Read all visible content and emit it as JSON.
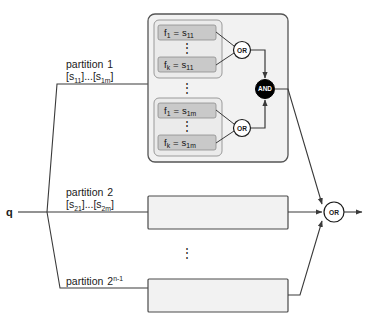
{
  "figure": {
    "input_label": "q",
    "output_gate_label": "OR",
    "vertical_ellipsis": "⋮",
    "colors": {
      "pill_fill": "#c9c9c9",
      "pill_stroke": "#8d8d8d",
      "inner_box_fill": "#ebebeb",
      "inner_box_stroke": "#9a9a9a",
      "outer_box_fill": "#f2f2f2",
      "outer_box_stroke": "#555555",
      "partition_box_fill": "#f2f2f2",
      "partition_box_stroke": "#4a4a4a",
      "and_gate_fill": "#000000",
      "and_gate_text": "#ffffff",
      "or_gate_fill": "#ffffff",
      "or_gate_stroke": "#1a1a1a",
      "wire": "#3a3a3a",
      "text": "#1a1a1a"
    },
    "partitions": [
      {
        "name": "partition",
        "index": "1",
        "range_open": "[",
        "range_first_base": "s",
        "range_first_sub": "11",
        "range_ellipsis": "]...[",
        "range_last_base": "s",
        "range_last_sub": "1m",
        "range_close": "]",
        "expanded": true,
        "clause_groups": [
          {
            "id": "clause-group-1",
            "rows": [
              {
                "fn_base": "f",
                "fn_sub": "1",
                "eq": "=",
                "val_base": "s",
                "val_sub": "11"
              },
              {
                "fn_base": "f",
                "fn_sub": "k",
                "eq": "=",
                "val_base": "s",
                "val_sub": "11"
              }
            ],
            "gate_label": "OR"
          },
          {
            "id": "clause-group-m",
            "rows": [
              {
                "fn_base": "f",
                "fn_sub": "1",
                "eq": "=",
                "val_base": "s",
                "val_sub": "1m"
              },
              {
                "fn_base": "f",
                "fn_sub": "k",
                "eq": "=",
                "val_base": "s",
                "val_sub": "1m"
              }
            ],
            "gate_label": "OR"
          }
        ],
        "and_gate_label": "AND"
      },
      {
        "name": "partition",
        "index": "2",
        "range_open": "[",
        "range_first_base": "s",
        "range_first_sub": "21",
        "range_ellipsis": "]...[",
        "range_last_base": "s",
        "range_last_sub": "2m",
        "range_close": "]",
        "expanded": false
      },
      {
        "name": "partition",
        "index_base": "2",
        "index_sup": "n-1",
        "expanded": false
      }
    ]
  }
}
